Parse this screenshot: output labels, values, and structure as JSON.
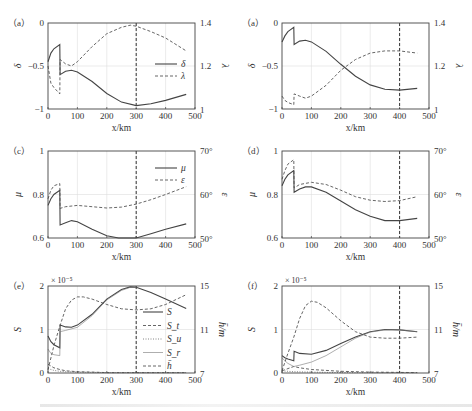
{
  "chart_data": [
    {
      "panel": "a-left",
      "label": "（a）",
      "type": "line",
      "xlabel": "x/km",
      "xlim": [
        0,
        500
      ],
      "xticks": [
        0,
        100,
        200,
        300,
        400,
        500
      ],
      "ylabel_left": "δ",
      "ylim_left": [
        -1,
        0
      ],
      "yticks_left": [
        "-1",
        "-0.5",
        "0"
      ],
      "ylabel_right": "λ",
      "ylim_right": [
        1,
        1.4
      ],
      "yticks_right": [
        "1",
        "1.2",
        "1.4"
      ],
      "vline_x": 300,
      "grid": true,
      "legend": [
        "δ",
        "λ"
      ],
      "legend_position": "right-middle",
      "series": [
        {
          "name": "δ",
          "axis": "left",
          "style": "solid",
          "x": [
            0,
            10,
            20,
            40,
            41,
            60,
            80,
            100,
            150,
            200,
            250,
            300,
            350,
            400,
            470
          ],
          "y": [
            -0.45,
            -0.35,
            -0.3,
            -0.25,
            -0.6,
            -0.56,
            -0.55,
            -0.57,
            -0.68,
            -0.82,
            -0.92,
            -0.96,
            -0.94,
            -0.9,
            -0.83
          ]
        },
        {
          "name": "λ",
          "axis": "right",
          "style": "dashed",
          "x": [
            0,
            10,
            20,
            40,
            41,
            60,
            80,
            100,
            150,
            200,
            250,
            280,
            300,
            350,
            400,
            470
          ],
          "y": [
            1.2,
            1.12,
            1.1,
            1.07,
            1.23,
            1.21,
            1.2,
            1.22,
            1.29,
            1.35,
            1.38,
            1.39,
            1.385,
            1.36,
            1.33,
            1.27
          ]
        }
      ]
    },
    {
      "panel": "a-right",
      "label": "（a）",
      "type": "line",
      "xlabel": "x/km",
      "xlim": [
        0,
        500
      ],
      "xticks": [
        0,
        100,
        200,
        300,
        400,
        500
      ],
      "ylabel_left": "δ",
      "ylim_left": [
        -1,
        0
      ],
      "yticks_left": [
        "-1",
        "-0.5",
        "0"
      ],
      "ylabel_right": "λ",
      "ylim_right": [
        1,
        1.4
      ],
      "yticks_right": [
        "1",
        "1.2",
        "1.4"
      ],
      "vline_x": 400,
      "grid": true,
      "series": [
        {
          "name": "δ",
          "axis": "left",
          "style": "solid",
          "x": [
            0,
            10,
            20,
            40,
            41,
            60,
            80,
            100,
            150,
            200,
            250,
            300,
            350,
            400,
            460
          ],
          "y": [
            -0.22,
            -0.15,
            -0.1,
            -0.05,
            -0.25,
            -0.21,
            -0.2,
            -0.22,
            -0.33,
            -0.48,
            -0.62,
            -0.72,
            -0.77,
            -0.78,
            -0.76
          ]
        },
        {
          "name": "λ",
          "axis": "right",
          "style": "dashed",
          "x": [
            0,
            10,
            20,
            40,
            41,
            60,
            80,
            100,
            150,
            200,
            250,
            300,
            350,
            400,
            460
          ],
          "y": [
            1.06,
            1.04,
            1.03,
            1.02,
            1.07,
            1.06,
            1.05,
            1.06,
            1.11,
            1.18,
            1.23,
            1.26,
            1.27,
            1.27,
            1.26
          ]
        }
      ]
    },
    {
      "panel": "c",
      "label": "（c）",
      "type": "line",
      "xlabel": "x/km",
      "xlim": [
        0,
        500
      ],
      "xticks": [
        0,
        100,
        200,
        300,
        400,
        500
      ],
      "ylabel_left": "μ",
      "ylim_left": [
        0.6,
        1
      ],
      "yticks_left": [
        "0.6",
        "0.8",
        "1"
      ],
      "ylabel_right": "ε",
      "ylim_right": [
        50,
        70
      ],
      "yticks_right": [
        "50°",
        "60°",
        "70°"
      ],
      "vline_x": 300,
      "grid": true,
      "legend": [
        "μ",
        "ε"
      ],
      "legend_position": "upper-right",
      "series": [
        {
          "name": "μ",
          "axis": "left",
          "style": "solid",
          "x": [
            0,
            10,
            20,
            40,
            41,
            60,
            80,
            100,
            150,
            200,
            240,
            280,
            300,
            350,
            400,
            470
          ],
          "y": [
            0.75,
            0.78,
            0.8,
            0.82,
            0.66,
            0.67,
            0.68,
            0.675,
            0.64,
            0.61,
            0.6,
            0.6,
            0.6,
            0.62,
            0.64,
            0.665
          ]
        },
        {
          "name": "ε",
          "axis": "right",
          "style": "dashed",
          "x": [
            0,
            10,
            20,
            40,
            41,
            60,
            100,
            150,
            200,
            250,
            300,
            350,
            400,
            470
          ],
          "y": [
            59,
            61,
            62,
            62.5,
            56.8,
            57.2,
            57.5,
            57.2,
            56.9,
            57.1,
            57.8,
            58.8,
            60,
            61.8
          ]
        }
      ]
    },
    {
      "panel": "d",
      "label": "（d）",
      "type": "line",
      "xlabel": "x/km",
      "xlim": [
        0,
        500
      ],
      "xticks": [
        0,
        100,
        200,
        300,
        400,
        500
      ],
      "ylabel_left": "μ",
      "ylim_left": [
        0.6,
        1
      ],
      "yticks_left": [
        "0.6",
        "0.8",
        "1"
      ],
      "ylabel_right": "ε",
      "ylim_right": [
        50,
        70
      ],
      "yticks_right": [
        "50°",
        "60°",
        "70°"
      ],
      "vline_x": 400,
      "grid": true,
      "series": [
        {
          "name": "μ",
          "axis": "left",
          "style": "solid",
          "x": [
            0,
            10,
            20,
            40,
            41,
            60,
            80,
            100,
            150,
            200,
            250,
            300,
            350,
            400,
            460
          ],
          "y": [
            0.84,
            0.87,
            0.89,
            0.91,
            0.81,
            0.825,
            0.835,
            0.835,
            0.81,
            0.77,
            0.73,
            0.7,
            0.68,
            0.68,
            0.69
          ]
        },
        {
          "name": "ε",
          "axis": "right",
          "style": "dashed",
          "x": [
            0,
            10,
            20,
            40,
            41,
            60,
            100,
            150,
            200,
            250,
            300,
            350,
            400,
            460
          ],
          "y": [
            63.5,
            65.5,
            67,
            68,
            61.5,
            62.3,
            62.8,
            62.3,
            61,
            59.5,
            58.7,
            58.4,
            58.6,
            59.5
          ]
        }
      ]
    },
    {
      "panel": "e",
      "label": "（e）",
      "type": "line",
      "xlabel": "x/km",
      "xlim": [
        0,
        500
      ],
      "xticks": [
        0,
        100,
        200,
        300,
        400,
        500
      ],
      "ylabel_left": "S",
      "ylim_left": [
        0,
        2
      ],
      "yticks_left": [
        "0",
        "1",
        "2"
      ],
      "y_multiplier": "× 10⁻⁵",
      "ylabel_right": "h̄/m",
      "ylim_right": [
        7,
        15
      ],
      "yticks_right": [
        "7",
        "11",
        "15"
      ],
      "vline_x": 300,
      "grid": true,
      "legend": [
        "S",
        "S_t",
        "S_u",
        "S_r",
        "h̄"
      ],
      "legend_position": "right",
      "series": [
        {
          "name": "S",
          "axis": "left",
          "style": "solid",
          "x": [
            0,
            10,
            20,
            40,
            41,
            60,
            80,
            100,
            150,
            200,
            250,
            280,
            300,
            350,
            400,
            470
          ],
          "y": [
            0.85,
            0.72,
            0.65,
            0.58,
            1.1,
            1.06,
            1.05,
            1.1,
            1.35,
            1.7,
            1.92,
            1.98,
            1.97,
            1.85,
            1.7,
            1.48
          ]
        },
        {
          "name": "S_t",
          "axis": "left",
          "style": "dashed",
          "x": [
            0,
            20,
            40,
            60,
            100,
            150,
            200,
            300,
            400,
            470
          ],
          "y": [
            0.2,
            0.12,
            0.08,
            0.05,
            0.03,
            0.02,
            0.01,
            0.01,
            0.01,
            0.01
          ]
        },
        {
          "name": "S_u",
          "axis": "left",
          "style": "dotted",
          "x": [
            0,
            20,
            40,
            60,
            100,
            200,
            300,
            470
          ],
          "y": [
            0.1,
            0.06,
            0.04,
            0.03,
            0.02,
            0.01,
            0.01,
            0.01
          ]
        },
        {
          "name": "S_r",
          "axis": "left",
          "style": "thin-solid",
          "x": [
            0,
            10,
            20,
            40,
            41,
            60,
            100,
            150,
            200,
            250,
            280,
            300
          ],
          "y": [
            0.55,
            0.45,
            0.42,
            0.4,
            0.95,
            0.98,
            1.05,
            1.32,
            1.68,
            1.9,
            1.97,
            1.97
          ]
        },
        {
          "name": "h̄",
          "axis": "right",
          "style": "dashed",
          "x": [
            0,
            20,
            40,
            60,
            80,
            100,
            120,
            150,
            200,
            250,
            300,
            350,
            400,
            470
          ],
          "y": [
            7.3,
            9.5,
            11.3,
            12.9,
            13.7,
            14.0,
            14.0,
            13.8,
            13.3,
            12.9,
            12.8,
            12.9,
            13.3,
            14.2
          ]
        }
      ]
    },
    {
      "panel": "f",
      "label": "（f）",
      "type": "line",
      "xlabel": "x/km",
      "xlim": [
        0,
        500
      ],
      "xticks": [
        0,
        100,
        200,
        300,
        400,
        500
      ],
      "ylabel_left": "S",
      "ylim_left": [
        0,
        2
      ],
      "yticks_left": [
        "0",
        "1",
        "2"
      ],
      "y_multiplier": "× 10⁻⁵",
      "ylabel_right": "h̄/m",
      "ylim_right": [
        7,
        15
      ],
      "yticks_right": [
        "7",
        "11",
        "15"
      ],
      "vline_x": 400,
      "grid": true,
      "series": [
        {
          "name": "S",
          "axis": "left",
          "style": "solid",
          "x": [
            0,
            10,
            20,
            40,
            41,
            60,
            100,
            150,
            200,
            250,
            300,
            350,
            400,
            460
          ],
          "y": [
            0.4,
            0.35,
            0.32,
            0.28,
            0.5,
            0.45,
            0.43,
            0.52,
            0.68,
            0.83,
            0.95,
            1.0,
            0.99,
            0.95
          ]
        },
        {
          "name": "S_t",
          "axis": "left",
          "style": "dashed",
          "x": [
            0,
            20,
            40,
            60,
            100,
            200,
            300,
            460
          ],
          "y": [
            0.05,
            0.1,
            0.15,
            0.12,
            0.08,
            0.04,
            0.02,
            0.01
          ]
        },
        {
          "name": "S_u",
          "axis": "left",
          "style": "dotted",
          "x": [
            0,
            20,
            40,
            100,
            200,
            460
          ],
          "y": [
            0.05,
            0.04,
            0.03,
            0.02,
            0.01,
            0.01
          ]
        },
        {
          "name": "S_r",
          "axis": "left",
          "style": "thin-solid",
          "x": [
            0,
            10,
            20,
            40,
            60,
            100,
            150,
            200,
            250,
            300,
            350,
            400,
            460
          ],
          "y": [
            0.35,
            0.28,
            0.22,
            0.15,
            0.18,
            0.25,
            0.4,
            0.6,
            0.8,
            0.94,
            0.99,
            0.99,
            0.95
          ]
        },
        {
          "name": "h̄",
          "axis": "right",
          "style": "dashed",
          "x": [
            0,
            20,
            40,
            60,
            80,
            100,
            120,
            150,
            200,
            250,
            300,
            350,
            400,
            460
          ],
          "y": [
            7.2,
            8.8,
            10.3,
            12.0,
            13.2,
            13.6,
            13.5,
            13.0,
            11.8,
            10.8,
            10.3,
            10.2,
            10.2,
            10.3
          ]
        }
      ]
    }
  ],
  "panels": {
    "a_left": {
      "label": "（a）",
      "xlabel": "x/km",
      "yl": "δ",
      "yr": "λ",
      "legend": [
        "δ",
        "λ"
      ]
    },
    "a_right": {
      "label": "（a）",
      "xlabel": "x/km",
      "yl": "δ",
      "yr": "λ"
    },
    "c": {
      "label": "（c）",
      "xlabel": "x/km",
      "yl": "μ",
      "yr": "ε",
      "legend": [
        "μ",
        "ε"
      ]
    },
    "d": {
      "label": "（d）",
      "xlabel": "x/km",
      "yl": "μ",
      "yr": "ε"
    },
    "e": {
      "label": "（e）",
      "xlabel": "x/km",
      "yl": "S",
      "yr": "h̄/m",
      "mult": "× 10⁻⁵",
      "legend": [
        "S",
        "St",
        "Su",
        "Sr",
        "h̄"
      ]
    },
    "f": {
      "label": "（f）",
      "xlabel": "x/km",
      "yl": "S",
      "yr": "h̄/m",
      "mult": "× 10⁻⁵"
    }
  },
  "ticks": {
    "x": [
      "0",
      "100",
      "200",
      "300",
      "400",
      "500"
    ],
    "delta": [
      "−1",
      "−0.5",
      "0"
    ],
    "lambda": [
      "1",
      "1.2",
      "1.4"
    ],
    "mu": [
      "0.6",
      "0.8",
      "1"
    ],
    "eps": [
      "50°",
      "60°",
      "70°"
    ],
    "S": [
      "0",
      "1",
      "2"
    ],
    "h": [
      "7",
      "11",
      "15"
    ]
  }
}
